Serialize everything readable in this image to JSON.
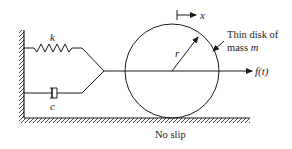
{
  "diagram": {
    "labels": {
      "spring": "k",
      "damper": "c",
      "radius": "r",
      "displacement": "x",
      "force": "f(t)",
      "disk_line1": "Thin disk of",
      "disk_line2_prefix": "mass ",
      "disk_line2_var": "m",
      "ground_condition": "No slip"
    },
    "components": [
      {
        "type": "wall",
        "side": "left"
      },
      {
        "type": "ground",
        "side": "bottom"
      },
      {
        "type": "spring",
        "label": "k"
      },
      {
        "type": "damper",
        "label": "c"
      },
      {
        "type": "disk",
        "label": "Thin disk of mass m",
        "radius_label": "r"
      },
      {
        "type": "force-arrow",
        "label": "f(t)"
      },
      {
        "type": "displacement-arrow",
        "label": "x"
      }
    ],
    "colors": {
      "stroke": "#1a1a1a",
      "background": "#ffffff"
    }
  }
}
